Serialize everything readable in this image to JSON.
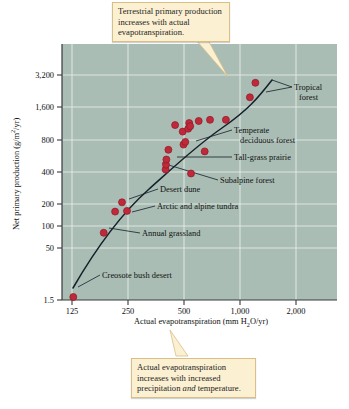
{
  "chart_data": {
    "type": "scatter",
    "title": "",
    "xlabel": "Actual evapotranspiration (mm H2O/yr)",
    "ylabel": "Net primary production (g/m2/yr)",
    "xscale": "log",
    "yscale": "log",
    "xlim": [
      125,
      2400
    ],
    "ylim": [
      1.5,
      4000
    ],
    "xticks": [
      125,
      250,
      500,
      1000,
      2000
    ],
    "xtick_labels": [
      "125",
      "250",
      "500",
      "1,000",
      "2,000"
    ],
    "yticks": [
      1.5,
      50,
      100,
      200,
      400,
      800,
      1600,
      3200
    ],
    "ytick_labels": [
      "1.5",
      "50",
      "100",
      "200",
      "400",
      "800",
      "1,600",
      "3,200"
    ],
    "grid": true,
    "legend": "none",
    "marker_color": "#c0293a",
    "trendline": true,
    "points": [
      {
        "x": 127,
        "y": 2.2,
        "label": "Creosote bush desert"
      },
      {
        "x": 185,
        "y": 72,
        "label": "Annual grassland"
      },
      {
        "x": 213,
        "y": 120,
        "label": ""
      },
      {
        "x": 232,
        "y": 150,
        "label": "Desert dune"
      },
      {
        "x": 247,
        "y": 122,
        "label": "Arctic and alpine tundra"
      },
      {
        "x": 398,
        "y": 330,
        "label": ""
      },
      {
        "x": 400,
        "y": 370,
        "label": ""
      },
      {
        "x": 402,
        "y": 420,
        "label": ""
      },
      {
        "x": 412,
        "y": 530,
        "label": ""
      },
      {
        "x": 448,
        "y": 960,
        "label": ""
      },
      {
        "x": 492,
        "y": 820,
        "label": ""
      },
      {
        "x": 497,
        "y": 600,
        "label": ""
      },
      {
        "x": 508,
        "y": 640,
        "label": ""
      },
      {
        "x": 527,
        "y": 880,
        "label": ""
      },
      {
        "x": 533,
        "y": 1010,
        "label": "Temperate deciduous forest"
      },
      {
        "x": 540,
        "y": 935,
        "label": ""
      },
      {
        "x": 545,
        "y": 300,
        "label": "Subalpine forest"
      },
      {
        "x": 600,
        "y": 1060,
        "label": ""
      },
      {
        "x": 646,
        "y": 510,
        "label": "Tall-grass prairie"
      },
      {
        "x": 690,
        "y": 1090,
        "label": ""
      },
      {
        "x": 840,
        "y": 1090,
        "label": ""
      },
      {
        "x": 1130,
        "y": 1870,
        "label": ""
      },
      {
        "x": 1210,
        "y": 2650,
        "label": "Tropical forest"
      }
    ],
    "annotations": [
      {
        "name": "tropical-forest",
        "text": "Tropical forest"
      },
      {
        "name": "temperate-deciduous-forest",
        "text": "Temperate deciduous forest"
      },
      {
        "name": "tall-grass-prairie",
        "text": "Tall-grass prairie"
      },
      {
        "name": "subalpine-forest",
        "text": "Subalpine forest"
      },
      {
        "name": "desert-dune",
        "text": "Desert dune"
      },
      {
        "name": "arctic-and-alpine-tundra",
        "text": "Arctic and alpine tundra"
      },
      {
        "name": "annual-grassland",
        "text": "Annual grassland"
      },
      {
        "name": "creosote-bush-desert",
        "text": "Creosote bush desert"
      }
    ]
  },
  "callouts": {
    "top": "Terrestrial primary production increases with actual evapotranspiration.",
    "bottom_part1": "Actual evapotranspiration increases with increased precipitation ",
    "bottom_italic": "and",
    "bottom_part2": " temperature."
  },
  "axis": {
    "x_title_pre": "Actual evapotranspiration (mm H",
    "x_title_sub": "2",
    "x_title_post": "O/yr)",
    "y_title_pre": "Net primary production (g/m",
    "y_title_sup": "2",
    "y_title_post": "/yr)"
  },
  "labels": {
    "tropical_line1": "Tropical",
    "tropical_line2": "forest",
    "temperate_line1": "Temperate",
    "temperate_line2": "deciduous forest",
    "tallgrass": "Tall-grass prairie",
    "subalpine": "Subalpine forest",
    "desert_dune": "Desert dune",
    "tundra": "Arctic and alpine tundra",
    "annual_grassland": "Annual grassland",
    "creosote": "Creosote bush desert"
  },
  "ticks": {
    "x": [
      "125",
      "250",
      "500",
      "1,000",
      "2,000"
    ],
    "y": [
      "3,200",
      "1,600",
      "800",
      "400",
      "200",
      "100",
      "50",
      "1.5"
    ]
  },
  "colors": {
    "plot_bg": "#a9bdb4",
    "marker": "#c0293a",
    "callout_bg": "#fbf0d2",
    "callout_border": "#d8bf86"
  }
}
